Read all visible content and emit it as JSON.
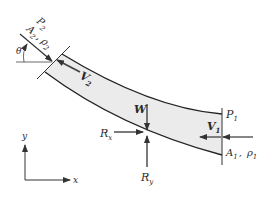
{
  "diagram": {
    "type": "control-volume free-body diagram of curved pipe section",
    "colors": {
      "fill": "#ebebeb",
      "stroke": "#222222",
      "background": "#ffffff"
    },
    "inlet_left": {
      "pressure": {
        "base": "P",
        "sub": "2"
      },
      "area": {
        "base": "A",
        "sub": "2"
      },
      "separator": ",",
      "density": {
        "base": "ρ",
        "sub": "2"
      },
      "velocity": {
        "base": "V",
        "sub": "2"
      },
      "angle": "θ"
    },
    "outlet_right": {
      "pressure": {
        "base": "P",
        "sub": "1"
      },
      "area": {
        "base": "A",
        "sub": "1"
      },
      "separator": ",",
      "density": {
        "base": "ρ",
        "sub": "1"
      },
      "velocity": {
        "base": "V",
        "sub": "1"
      }
    },
    "forces": {
      "weight": "W",
      "rx": {
        "base": "R",
        "sub": "x"
      },
      "ry": {
        "base": "R",
        "sub": "y"
      }
    },
    "axes": {
      "x": "x",
      "y": "y"
    }
  }
}
